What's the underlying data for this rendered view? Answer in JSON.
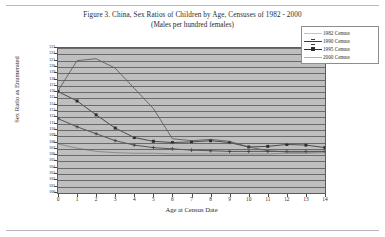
{
  "figure": {
    "title": "Figure 3.  China, Sex Ratios of Children by Age, Censuses of 1982 - 2000",
    "subtitle": "(Males per hundred females)"
  },
  "chart_data": {
    "type": "line",
    "title": "Figure 3.  China, Sex Ratios of Children by Age, Censuses of 1982 - 2000",
    "subtitle": "(Males per hundred females)",
    "xlabel": "Age at Census Date",
    "ylabel": "Sex Ratio as Enumerated",
    "xlim": [
      0,
      14
    ],
    "ylim": [
      100,
      123
    ],
    "grid": true,
    "legend_position": "top-right",
    "x": [
      0,
      1,
      2,
      3,
      4,
      5,
      6,
      7,
      8,
      9,
      10,
      11,
      12,
      13,
      14
    ],
    "xticklabels": [
      "0",
      "1",
      "2",
      "3",
      "4",
      "5",
      "6",
      "7",
      "8",
      "9",
      "10",
      "11",
      "12",
      "13",
      "14"
    ],
    "yticklabels": [
      "123",
      "122",
      "121",
      "120",
      "119",
      "118",
      "117",
      "116",
      "115",
      "114",
      "113",
      "112",
      "111",
      "110",
      "109",
      "108",
      "107",
      "106",
      "105",
      "104",
      "103",
      "102",
      "101",
      "100"
    ],
    "series": [
      {
        "name": "1982 Census",
        "marker": "none",
        "color": "#7d7d7d",
        "values": [
          107.8,
          107.1,
          106.6,
          106.4,
          106.3,
          106.3,
          106.2,
          106.2,
          106.2,
          106.2,
          106.2,
          106.2,
          106.3,
          106.3,
          106.4
        ]
      },
      {
        "name": "1990 Census",
        "marker": "cross",
        "color": "#3b3b3b",
        "values": [
          111.8,
          110.5,
          109.4,
          108.3,
          107.6,
          107.2,
          107.0,
          106.8,
          106.7,
          106.6,
          106.6,
          106.6,
          106.6,
          106.6,
          106.6
        ]
      },
      {
        "name": "1995 Census",
        "marker": "square",
        "color": "#2e2e2e",
        "values": [
          116.1,
          114.6,
          112.4,
          110.3,
          108.8,
          108.2,
          108.0,
          108.1,
          108.3,
          108.0,
          107.3,
          107.4,
          107.7,
          107.6,
          107.2
        ]
      },
      {
        "name": "2000 Census",
        "marker": "none",
        "color": "#545454",
        "values": [
          116.2,
          121.0,
          121.3,
          119.8,
          116.6,
          113.4,
          108.6,
          108.3,
          108.5,
          108.2,
          107.3,
          106.7,
          106.5,
          106.5,
          106.6
        ]
      }
    ]
  },
  "legend": {
    "items": [
      {
        "label": "1982  Census"
      },
      {
        "label": "1990  Census"
      },
      {
        "label": "1995  Census"
      },
      {
        "label": "2000  Census"
      }
    ]
  }
}
